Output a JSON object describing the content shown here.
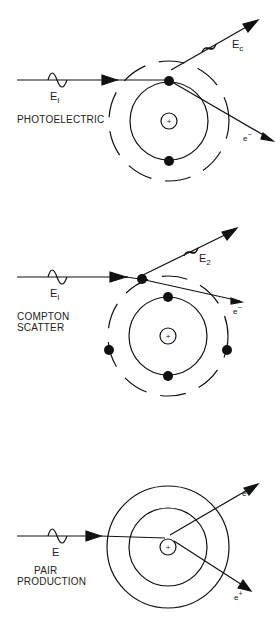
{
  "panels": [
    {
      "id": "photoelectric",
      "caption": "PHOTOELECTRIC",
      "incident": {
        "symbol": "E",
        "subscript": "I"
      },
      "outgoing_photon": {
        "symbol": "E",
        "subscript": "c"
      },
      "electron": {
        "symbol": "e",
        "superscript": "−"
      },
      "nucleus_sign": "+"
    },
    {
      "id": "compton",
      "caption_line1": "COMPTON",
      "caption_line2": "SCATTER",
      "incident": {
        "symbol": "E",
        "subscript": "I"
      },
      "outgoing_photon": {
        "symbol": "E",
        "subscript": "2"
      },
      "electron": {
        "symbol": "e",
        "superscript": "−"
      },
      "nucleus_sign": "+"
    },
    {
      "id": "pair-production",
      "caption_line1": "PAIR",
      "caption_line2": "PRODUCTION",
      "incident": {
        "symbol": "E"
      },
      "electron": {
        "symbol": "e",
        "superscript": "−"
      },
      "positron": {
        "symbol": "e",
        "superscript": "+"
      },
      "nucleus_sign": "+"
    }
  ],
  "colors": {
    "line": "#111111",
    "background": "#ffffff"
  }
}
